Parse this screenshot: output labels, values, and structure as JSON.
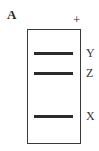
{
  "figure": {
    "panel_label": "A",
    "electrode_sign": "+",
    "bands": [
      {
        "label": "Y",
        "top": 52
      },
      {
        "label": "Z",
        "top": 72
      },
      {
        "label": "X",
        "top": 115
      }
    ],
    "colors": {
      "band": "#2b2b2b",
      "border": "#3a3a3a",
      "background": "#ffffff"
    }
  }
}
